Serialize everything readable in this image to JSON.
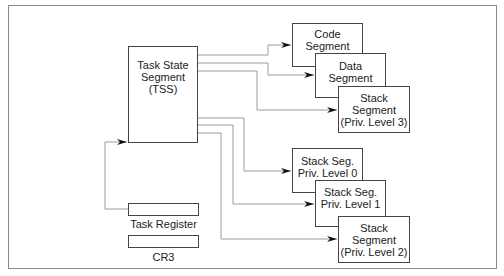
{
  "diagram": {
    "tss": {
      "lines": [
        "Task State",
        "Segment",
        "(TSS)"
      ]
    },
    "segments": {
      "code": {
        "lines": [
          "Code",
          "Segment"
        ]
      },
      "data": {
        "lines": [
          "Data",
          "Segment"
        ]
      },
      "stack3": {
        "lines": [
          "Stack",
          "Segment",
          "(Priv. Level 3)"
        ]
      },
      "stack0": {
        "lines": [
          "Stack Seg.",
          "Priv. Level 0"
        ]
      },
      "stack1": {
        "lines": [
          "Stack Seg.",
          "Priv. Level 1"
        ]
      },
      "stack2": {
        "lines": [
          "Stack",
          "Segment",
          "(Priv. Level 2)"
        ]
      }
    },
    "registers": {
      "task_register": {
        "label": "Task Register"
      },
      "cr3": {
        "label": "CR3"
      }
    },
    "colors": {
      "frame": "#8a8a8a",
      "box_border": "#444444",
      "wire": "#9a9a9a",
      "arrowhead": "#111111"
    }
  }
}
